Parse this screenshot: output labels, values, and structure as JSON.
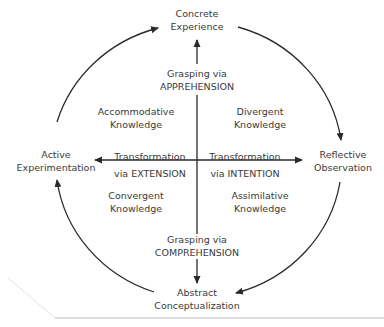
{
  "diagram": {
    "poles": {
      "top": {
        "line1": "Concrete",
        "line2": "Experience"
      },
      "right": {
        "line1": "Reflective",
        "line2": "Observation"
      },
      "bottom": {
        "line1": "Abstract",
        "line2": "Conceptualization"
      },
      "left": {
        "line1": "Active",
        "line2": "Experimentation"
      }
    },
    "axes": {
      "apprehension": {
        "line1": "Grasping via",
        "line2": "APPREHENSION"
      },
      "comprehension": {
        "line1": "Grasping via",
        "line2": "COMPREHENSION"
      },
      "extension": {
        "line1": "Transformation",
        "line2": "via EXTENSION"
      },
      "intention": {
        "line1": "Transformation",
        "line2": "via INTENTION"
      }
    },
    "quadrants": {
      "top_left": {
        "line1": "Accommodative",
        "line2": "Knowledge"
      },
      "top_right": {
        "line1": "Divergent",
        "line2": "Knowledge"
      },
      "bottom_left": {
        "line1": "Convergent",
        "line2": "Knowledge"
      },
      "bottom_right": {
        "line1": "Assimilative",
        "line2": "Knowledge"
      }
    },
    "colors": {
      "line": "#2a2a2a",
      "text": "#3a3a3a",
      "rule": "#bdbdbd"
    }
  }
}
